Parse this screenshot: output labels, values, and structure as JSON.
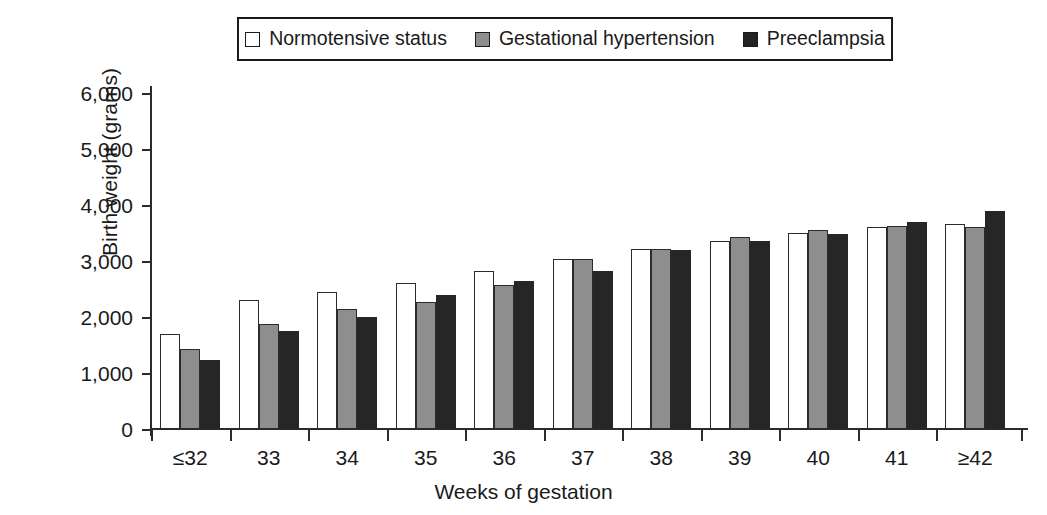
{
  "chart_data": {
    "type": "bar",
    "title": "",
    "xlabel": "Weeks of gestation",
    "ylabel": "Birth weight (grams)",
    "categories": [
      "≤32",
      "33",
      "34",
      "35",
      "36",
      "37",
      "38",
      "39",
      "40",
      "41",
      "≥42"
    ],
    "series": [
      {
        "name": "Normotensive status",
        "color": "#ffffff",
        "values": [
          1700,
          2300,
          2440,
          2600,
          2820,
          3030,
          3210,
          3360,
          3500,
          3610,
          3660
        ]
      },
      {
        "name": "Gestational hypertension",
        "color": "#8e8e8e",
        "values": [
          1430,
          1880,
          2140,
          2270,
          2580,
          3030,
          3210,
          3430,
          3560,
          3630,
          3600
        ]
      },
      {
        "name": "Preeclampsia",
        "color": "#262626",
        "values": [
          1230,
          1750,
          2000,
          2400,
          2650,
          2820,
          3190,
          3360,
          3480,
          3690,
          3900
        ]
      }
    ],
    "ylim": [
      0,
      6000
    ],
    "ytick_values": [
      0,
      1000,
      2000,
      3000,
      4000,
      5000,
      6000
    ],
    "ytick_labels": [
      "0",
      "1,000",
      "2,000",
      "3,000",
      "4,000",
      "5,000",
      "6,000"
    ],
    "grid": false,
    "legend_position": "top-center"
  },
  "legend": {
    "items": [
      {
        "label": "Normotensive status",
        "swatch": "white-square-icon"
      },
      {
        "label": "Gestational hypertension",
        "swatch": "gray-square-icon"
      },
      {
        "label": "Preeclampsia",
        "swatch": "black-square-icon"
      }
    ]
  }
}
